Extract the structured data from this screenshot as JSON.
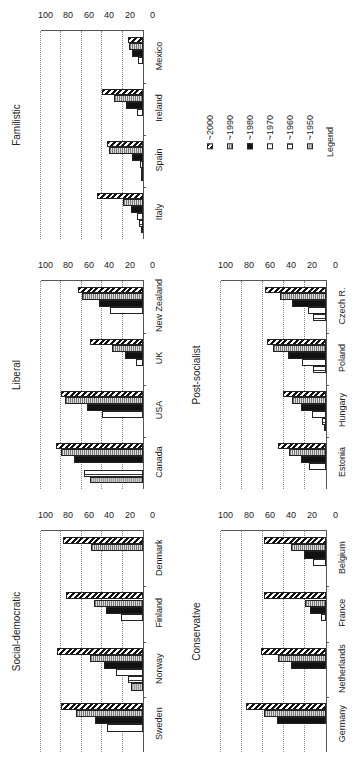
{
  "legend": {
    "title": "Legend",
    "items": [
      {
        "key": "1950",
        "label": "~1950",
        "pattern": "p1950"
      },
      {
        "key": "1960",
        "label": "~1960",
        "pattern": "p1960"
      },
      {
        "key": "1970",
        "label": "~1970",
        "pattern": "p1970"
      },
      {
        "key": "1980",
        "label": "~1980",
        "pattern": "p1980"
      },
      {
        "key": "1990",
        "label": "~1990",
        "pattern": "p1990"
      },
      {
        "key": "2000",
        "label": "~2000",
        "pattern": "p2000"
      }
    ]
  },
  "yticks": [
    "0",
    "20",
    "40",
    "60",
    "80",
    "100"
  ],
  "chart_data": [
    {
      "type": "bar",
      "title": "Familistic",
      "categories": [
        "Italy",
        "Spain",
        "Ireland",
        "Mexico"
      ],
      "series_names": [
        "~1950",
        "~1960",
        "~1970",
        "~1980",
        "~1990",
        "~2000"
      ],
      "values": [
        [
          2,
          4,
          6,
          12,
          20,
          45
        ],
        [
          1,
          2,
          3,
          11,
          33,
          35
        ],
        [
          null,
          null,
          6,
          17,
          28,
          40
        ],
        [
          null,
          null,
          5,
          11,
          14,
          15
        ]
      ],
      "ylim": [
        0,
        100
      ],
      "grid": true
    },
    {
      "type": "bar",
      "title": "Liberal",
      "categories": [
        "Canada",
        "USA",
        "UK",
        "New Zealand"
      ],
      "series_names": [
        "~1950",
        "~1960",
        "~1970",
        "~1980",
        "~1990",
        "~2000"
      ],
      "values": [
        [
          52,
          58,
          null,
          68,
          80,
          85
        ],
        [
          null,
          null,
          40,
          55,
          76,
          80
        ],
        [
          null,
          null,
          7,
          18,
          30,
          52
        ],
        [
          null,
          null,
          32,
          43,
          60,
          64
        ]
      ],
      "ylim": [
        0,
        100
      ],
      "grid": true
    },
    {
      "type": "bar",
      "title": "Social-democratic",
      "categories": [
        "Sweden",
        "Norway",
        "Finland",
        "Denmark"
      ],
      "series_names": [
        "~1950",
        "~1960",
        "~1970",
        "~1980",
        "~1990",
        "~2000"
      ],
      "values": [
        [
          null,
          null,
          35,
          47,
          66,
          80
        ],
        [
          12,
          15,
          26,
          38,
          52,
          84
        ],
        [
          null,
          null,
          22,
          36,
          48,
          75
        ],
        [
          null,
          null,
          null,
          null,
          51,
          78
        ]
      ],
      "ylim": [
        0,
        100
      ],
      "grid": true
    },
    {
      "type": "bar",
      "title": "Post-socialist",
      "categories": [
        "Estonia",
        "Hungary",
        "Poland",
        "Czech R."
      ],
      "series_names": [
        "~1950",
        "~1960",
        "~1970",
        "~1980",
        "~1990",
        "~2000"
      ],
      "values": [
        [
          null,
          null,
          16,
          24,
          35,
          46
        ],
        [
          2,
          4,
          13,
          24,
          32,
          41
        ],
        [
          null,
          12,
          23,
          36,
          50,
          56
        ],
        [
          null,
          12,
          17,
          32,
          44,
          58
        ]
      ],
      "ylim": [
        0,
        100
      ],
      "grid": true
    },
    {
      "type": "bar",
      "title": "Conservative",
      "categories": [
        "Germany",
        "Netherlands",
        "France",
        "Belgium"
      ],
      "series_names": [
        "~1950",
        "~1960",
        "~1970",
        "~1980",
        "~1990",
        "~2000"
      ],
      "values": [
        [
          null,
          null,
          null,
          47,
          59,
          76
        ],
        [
          null,
          null,
          null,
          33,
          46,
          62
        ],
        [
          null,
          null,
          5,
          15,
          20,
          59
        ],
        [
          null,
          null,
          12,
          21,
          33,
          59
        ]
      ],
      "ylim": [
        0,
        100
      ],
      "grid": true
    }
  ]
}
